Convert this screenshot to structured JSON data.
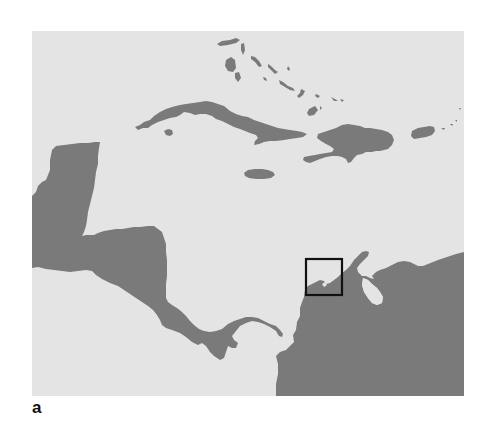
{
  "figure": {
    "panel_label": "a",
    "map": {
      "region": "Caribbean Sea and Central America",
      "colors": {
        "sea": "#e4e4e4",
        "land": "#7a7a7a",
        "highlight_box": "#111111"
      },
      "features": [
        {
          "name": "Cuba",
          "type": "land"
        },
        {
          "name": "Isla de la Juventud",
          "type": "land"
        },
        {
          "name": "Bahamas",
          "type": "land"
        },
        {
          "name": "Hispaniola",
          "type": "land"
        },
        {
          "name": "Jamaica",
          "type": "land"
        },
        {
          "name": "Puerto Rico",
          "type": "land"
        },
        {
          "name": "Yucatan Peninsula",
          "type": "land"
        },
        {
          "name": "Central America",
          "type": "land"
        },
        {
          "name": "South America",
          "type": "land"
        },
        {
          "name": "Lake Maracaibo",
          "type": "water"
        }
      ],
      "highlight_box": {
        "description": "study area inset marker on northern Colombian coast"
      }
    }
  }
}
